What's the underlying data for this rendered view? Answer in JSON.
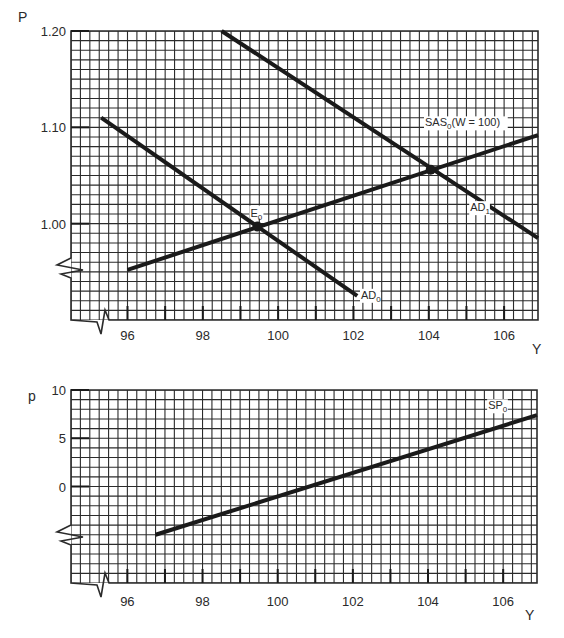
{
  "chart_data": [
    {
      "type": "line",
      "title": "",
      "xlabel": "Y",
      "ylabel": "P",
      "xlim": [
        94.5,
        106.9
      ],
      "ylim": [
        0.9,
        1.2
      ],
      "x_ticks": [
        96,
        98,
        100,
        102,
        104,
        106
      ],
      "x_minor_ticks": [
        96,
        97,
        98,
        99,
        100,
        101,
        102,
        103,
        104,
        105,
        106
      ],
      "y_ticks": [
        {
          "value": 1.2,
          "label": "1.20"
        },
        {
          "value": 1.1,
          "label": "1.10"
        },
        {
          "value": 1.0,
          "label": "1.00"
        }
      ],
      "grid": true,
      "grid_step_x": 0.25,
      "grid_step_y": 0.01,
      "axis_breaks": {
        "y_at": 0.955,
        "x_at": 95.25
      },
      "series": [
        {
          "name": "AD0",
          "label": "AD",
          "sub": "0",
          "points": [
            [
              95.3,
              1.11
            ],
            [
              102.1,
              0.925
            ]
          ],
          "label_pos": [
            102.2,
            0.922
          ]
        },
        {
          "name": "AD1",
          "label": "AD",
          "sub": "1",
          "points": [
            [
              98.5,
              1.2
            ],
            [
              106.9,
              0.985
            ]
          ],
          "label_pos": [
            105.1,
            1.013
          ]
        },
        {
          "name": "SAS0 (W = 100)",
          "label": "SAS",
          "sub": "0",
          "suffix": "(W = 100)",
          "points": [
            [
              96.0,
              0.952
            ],
            [
              106.9,
              1.092
            ]
          ],
          "label_pos": [
            103.9,
            1.101
          ]
        }
      ],
      "points": [
        {
          "name": "E0",
          "label": "E",
          "sub": "0",
          "x": 99.45,
          "y": 0.997
        },
        {
          "name": "E1",
          "label": "",
          "sub": "",
          "x": 104.05,
          "y": 1.056
        }
      ]
    },
    {
      "type": "line",
      "title": "",
      "xlabel": "Y",
      "ylabel": "p",
      "xlim": [
        94.5,
        106.9
      ],
      "ylim": [
        -10,
        10
      ],
      "x_ticks": [
        96,
        98,
        100,
        102,
        104,
        106
      ],
      "x_minor_ticks": [
        96,
        97,
        98,
        99,
        100,
        101,
        102,
        103,
        104,
        105,
        106
      ],
      "y_ticks": [
        {
          "value": 10,
          "label": "10"
        },
        {
          "value": 5,
          "label": "5"
        },
        {
          "value": 0,
          "label": "0"
        }
      ],
      "grid": true,
      "grid_step_x": 0.25,
      "grid_step_y": 1,
      "axis_breaks": {
        "y_at": -5.0,
        "x_at": 95.25
      },
      "series": [
        {
          "name": "SP0",
          "label": "SP",
          "sub": "0",
          "points": [
            [
              96.75,
              -5.0
            ],
            [
              106.9,
              7.4
            ]
          ],
          "label_pos": [
            105.6,
            8.0
          ]
        }
      ],
      "points": []
    }
  ],
  "layout": {
    "panels": [
      {
        "x0": 71,
        "x1": 538,
        "y0": 31,
        "y1": 320,
        "ylabel_x": 18,
        "ylabel_y": 22,
        "xlabel_x": 532,
        "xlabel_y": 354,
        "tick_label_y": 340,
        "break_y": 268,
        "break_x": 99
      },
      {
        "x0": 71,
        "x1": 537,
        "y0": 390,
        "y1": 583,
        "ylabel_x": 28,
        "ylabel_y": 401,
        "xlabel_x": 525,
        "xlabel_y": 620,
        "tick_label_y": 606,
        "break_y": 535,
        "break_x": 99
      }
    ],
    "colors": {
      "grid": "#2b2b2b",
      "curve": "#1a1a1a",
      "text": "#2a2a2a",
      "background": "#ffffff"
    }
  }
}
